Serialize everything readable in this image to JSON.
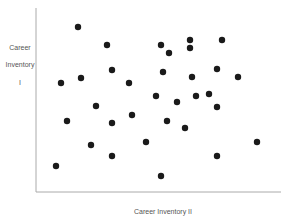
{
  "chart_data": {
    "type": "scatter",
    "title": "",
    "xlabel": "Career Inventory II",
    "ylabel_lines": [
      "Career",
      "Inventory",
      "I"
    ],
    "grid": false,
    "legend": null,
    "axis_ticks": false,
    "note": "Points given in pixel-relative coordinates (x from y-axis, y up from x-axis); no numeric ticks shown",
    "points": [
      {
        "x": 42,
        "y": 165
      },
      {
        "x": 71,
        "y": 147
      },
      {
        "x": 125,
        "y": 147
      },
      {
        "x": 154,
        "y": 152
      },
      {
        "x": 186,
        "y": 152
      },
      {
        "x": 154,
        "y": 144
      },
      {
        "x": 133,
        "y": 139
      },
      {
        "x": 76,
        "y": 122
      },
      {
        "x": 127,
        "y": 120
      },
      {
        "x": 181,
        "y": 123
      },
      {
        "x": 25,
        "y": 109
      },
      {
        "x": 45,
        "y": 114
      },
      {
        "x": 93,
        "y": 109
      },
      {
        "x": 157,
        "y": 115
      },
      {
        "x": 202,
        "y": 115
      },
      {
        "x": 120,
        "y": 96
      },
      {
        "x": 141,
        "y": 90
      },
      {
        "x": 160,
        "y": 96
      },
      {
        "x": 173,
        "y": 98
      },
      {
        "x": 181,
        "y": 85
      },
      {
        "x": 60,
        "y": 86
      },
      {
        "x": 96,
        "y": 77
      },
      {
        "x": 31,
        "y": 71
      },
      {
        "x": 76,
        "y": 69
      },
      {
        "x": 131,
        "y": 71
      },
      {
        "x": 149,
        "y": 64
      },
      {
        "x": 55,
        "y": 47
      },
      {
        "x": 110,
        "y": 50
      },
      {
        "x": 181,
        "y": 36
      },
      {
        "x": 221,
        "y": 50
      },
      {
        "x": 76,
        "y": 36
      },
      {
        "x": 20,
        "y": 26
      },
      {
        "x": 125,
        "y": 16
      }
    ]
  },
  "pixels": {
    "dots": [
      [
        78,
        27
      ],
      [
        107,
        45
      ],
      [
        161,
        45
      ],
      [
        190,
        40
      ],
      [
        222,
        40
      ],
      [
        169,
        53
      ],
      [
        190,
        48
      ],
      [
        112,
        70
      ],
      [
        163,
        72
      ],
      [
        217,
        69
      ],
      [
        61,
        83
      ],
      [
        81,
        78
      ],
      [
        129,
        83
      ],
      [
        192,
        77
      ],
      [
        238,
        77
      ],
      [
        156,
        96
      ],
      [
        177,
        102
      ],
      [
        196,
        96
      ],
      [
        209,
        94
      ],
      [
        96,
        106
      ],
      [
        217,
        107
      ],
      [
        132,
        115
      ],
      [
        167,
        121
      ],
      [
        185,
        128
      ],
      [
        67,
        121
      ],
      [
        112,
        123
      ],
      [
        91,
        145
      ],
      [
        146,
        142
      ],
      [
        257,
        142
      ],
      [
        217,
        156
      ],
      [
        112,
        156
      ],
      [
        56,
        166
      ],
      [
        161,
        176
      ]
    ]
  }
}
